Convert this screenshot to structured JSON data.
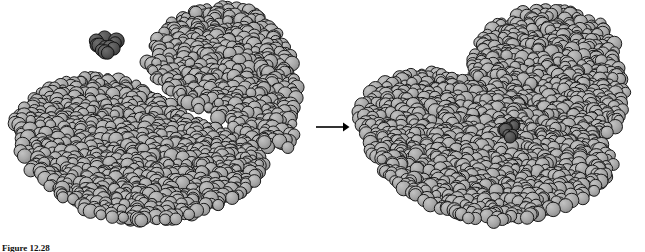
{
  "figure": {
    "caption_label": "Figure",
    "caption_number": "12.28",
    "caption_text": "",
    "background_color": "#ffffff"
  },
  "colors": {
    "protein_sphere": "#a8a8a8",
    "protein_sphere_shade": "#8f8f8f",
    "protein_outline": "#1a1a1a",
    "substrate_sphere": "#555555",
    "substrate_outline": "#121212",
    "arrow": "#000000"
  },
  "panels": [
    {
      "id": "open-conformation",
      "name": "open-conformation-panel",
      "label": "",
      "substrate_state": "free",
      "substrate": {
        "name": "free-substrate-cluster",
        "cx": 106,
        "cy": 43,
        "radius": 15,
        "atom_count": 12
      },
      "lobes": [
        {
          "name": "large-lobe",
          "cx": 120,
          "cy": 155
        },
        {
          "name": "small-lobe",
          "cx": 232,
          "cy": 105
        }
      ],
      "cleft": {
        "name": "open-active-site-cleft",
        "x": 168,
        "y": 70
      }
    },
    {
      "id": "closed-conformation",
      "name": "closed-conformation-panel",
      "label": "",
      "substrate_state": "bound",
      "substrate": {
        "name": "bound-substrate-cluster",
        "cx": 512,
        "cy": 130,
        "radius": 11,
        "atom_count": 9
      },
      "lobes": [
        {
          "name": "large-lobe",
          "cx": 445,
          "cy": 140
        },
        {
          "name": "small-lobe",
          "cx": 545,
          "cy": 105
        }
      ],
      "cleft": {
        "name": "closed-active-site-cleft",
        "x": 505,
        "y": 125
      }
    }
  ],
  "arrow": {
    "name": "transition-arrow",
    "direction": "right",
    "label": ""
  }
}
